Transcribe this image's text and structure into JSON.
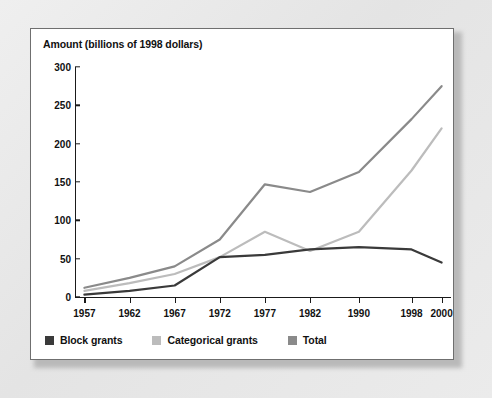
{
  "chart_data": {
    "type": "line",
    "title": "Amount (billions of 1998 dollars)",
    "xlabel": "",
    "ylabel": "Amount (billions of 1998 dollars)",
    "categories": [
      "1957",
      "1962",
      "1967",
      "1972",
      "1977",
      "1982",
      "1990",
      "1998",
      "2000"
    ],
    "x_tick_labels": [
      "1957",
      "1962",
      "1967",
      "1972",
      "1977",
      "1982",
      "1990",
      "1998",
      "2000"
    ],
    "y_tick_labels": [
      "0",
      "50",
      "100",
      "150",
      "200",
      "250",
      "300"
    ],
    "y_ticks": [
      0,
      50,
      100,
      150,
      200,
      250,
      300
    ],
    "ylim": [
      0,
      300
    ],
    "grid": false,
    "legend_position": "bottom-left",
    "series": [
      {
        "name": "Block grants",
        "color": "#3a3a3a",
        "values": [
          3,
          8,
          15,
          52,
          55,
          62,
          65,
          62,
          45
        ]
      },
      {
        "name": "Categorical grants",
        "color": "#bcbcbc",
        "values": [
          8,
          18,
          30,
          52,
          85,
          60,
          85,
          165,
          220
        ]
      },
      {
        "name": "Total",
        "color": "#8a8a8a",
        "values": [
          12,
          25,
          40,
          75,
          147,
          137,
          163,
          232,
          275
        ]
      }
    ]
  },
  "legend": {
    "entries": [
      {
        "label": "Block grants",
        "color": "#3a3a3a"
      },
      {
        "label": "Categorical grants",
        "color": "#bcbcbc"
      },
      {
        "label": "Total",
        "color": "#8a8a8a"
      }
    ]
  }
}
